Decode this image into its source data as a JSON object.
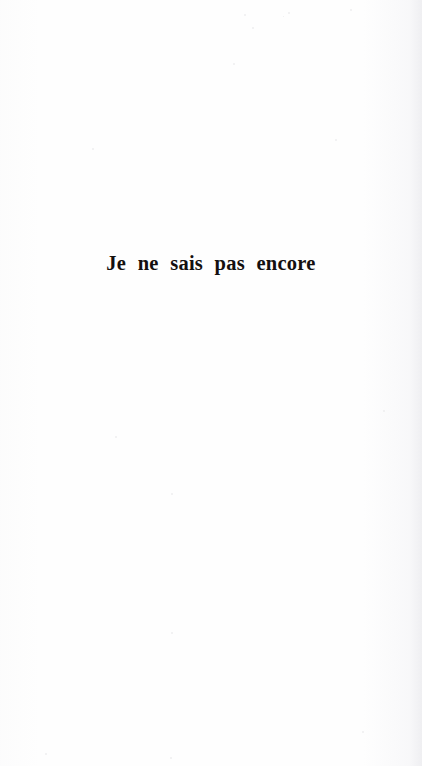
{
  "document": {
    "kind": "scanned-book-page",
    "page_type": "part-title-page",
    "language": "fr",
    "background_color": "#fefefe",
    "ink_color": "#14100f"
  },
  "content": {
    "part_title": "Je ne sais pas encore"
  },
  "marks": {
    "specks": [
      {
        "x": 244,
        "y": 14,
        "size": 2
      },
      {
        "x": 288,
        "y": 12,
        "size": 2
      },
      {
        "x": 350,
        "y": 9,
        "size": 2
      },
      {
        "x": 252,
        "y": 27,
        "size": 2
      },
      {
        "x": 283,
        "y": 16,
        "size": 1
      },
      {
        "x": 233,
        "y": 63,
        "size": 2
      },
      {
        "x": 92,
        "y": 148,
        "size": 2
      },
      {
        "x": 335,
        "y": 139,
        "size": 2
      },
      {
        "x": 115,
        "y": 436,
        "size": 2
      },
      {
        "x": 171,
        "y": 493,
        "size": 2
      },
      {
        "x": 383,
        "y": 410,
        "size": 2
      },
      {
        "x": 171,
        "y": 632,
        "size": 2
      },
      {
        "x": 45,
        "y": 753,
        "size": 2
      },
      {
        "x": 170,
        "y": 757,
        "size": 2
      },
      {
        "x": 362,
        "y": 731,
        "size": 2
      }
    ]
  }
}
